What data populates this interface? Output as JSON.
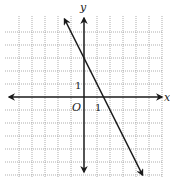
{
  "chart_data": {
    "type": "line",
    "title": "",
    "xlabel": "x",
    "ylabel": "y",
    "origin_label": "O",
    "tick_labels": {
      "x": "1",
      "y": "1"
    },
    "xlim": [
      -6,
      6
    ],
    "ylim": [
      -6,
      6
    ],
    "grid": true,
    "grid_step": 1,
    "series": [
      {
        "name": "y = -2x + 3",
        "equation": "y = -2x + 3",
        "slope": -2,
        "y_intercept": 3,
        "x_intercept": 1.5,
        "x": [
          -1.5,
          4.5
        ],
        "y": [
          6,
          -6
        ],
        "arrows": "both"
      }
    ]
  },
  "labels": {
    "x_axis": "x",
    "y_axis": "y",
    "origin": "O",
    "x_tick": "1",
    "y_tick": "1"
  },
  "colors": {
    "axis": "#1a1a1a",
    "grid": "#8a8a8a",
    "line": "#1a1a1a",
    "background": "#ffffff"
  }
}
